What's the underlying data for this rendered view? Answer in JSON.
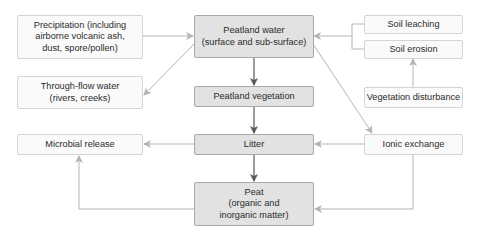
{
  "diagram": {
    "nodes": {
      "precipitation": "Precipitation (including\nairborne volcanic ash,\ndust, spore/pollen)",
      "through_flow": "Through-flow water\n(rivers, creeks)",
      "microbial_release": "Microbial release",
      "peatland_water": "Peatland water\n(surface and sub-surface)",
      "peatland_vegetation": "Peatland vegetation",
      "litter": "Litter",
      "peat": "Peat\n(organic and\ninorganic matter)",
      "soil_leaching": "Soil leaching",
      "soil_erosion": "Soil erosion",
      "vegetation_disturbance": "Vegetation disturbance",
      "ionic_exchange": "Ionic exchange"
    },
    "edges": [
      {
        "from": "precipitation",
        "to": "peatland_water"
      },
      {
        "from": "peatland_water",
        "to": "through_flow"
      },
      {
        "from": "soil_leaching",
        "to": "peatland_water"
      },
      {
        "from": "soil_erosion",
        "to": "peatland_water"
      },
      {
        "from": "vegetation_disturbance",
        "to": "soil_erosion"
      },
      {
        "from": "peatland_water",
        "to": "peatland_vegetation"
      },
      {
        "from": "peatland_water",
        "to": "ionic_exchange"
      },
      {
        "from": "peatland_vegetation",
        "to": "litter"
      },
      {
        "from": "litter",
        "to": "microbial_release"
      },
      {
        "from": "ionic_exchange",
        "to": "litter"
      },
      {
        "from": "litter",
        "to": "peat"
      },
      {
        "from": "ionic_exchange",
        "to": "peat"
      },
      {
        "from": "peat",
        "to": "microbial_release"
      }
    ],
    "colors": {
      "core_fill": "#e2e2e2",
      "core_border": "#a9a9a9",
      "side_fill": "#fafafa",
      "side_border": "#d4d4d4",
      "arrow_dark": "#5a5a5a",
      "arrow_light": "#b5b5b5"
    }
  }
}
